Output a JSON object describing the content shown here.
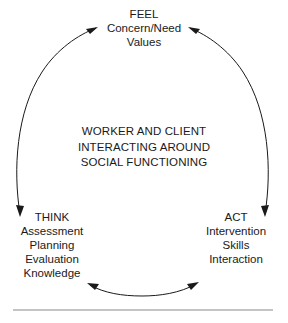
{
  "diagram": {
    "title": "Worker and Client Interacting Around Social Functioning",
    "type": "cyclical-process",
    "center": {
      "lines": [
        "WORKER AND CLIENT",
        "INTERACTING AROUND",
        "SOCIAL FUNCTIONING"
      ]
    },
    "nodes": [
      {
        "id": "feel",
        "position": "top",
        "title": "FEEL",
        "lines": [
          "Concern/Need",
          "Values"
        ]
      },
      {
        "id": "think",
        "position": "bottom-left",
        "title": "THINK",
        "lines": [
          "Assessment",
          "Planning",
          "Evaluation",
          "Knowledge"
        ]
      },
      {
        "id": "act",
        "position": "bottom-right",
        "title": "ACT",
        "lines": [
          "Intervention",
          "Skills",
          "Interaction"
        ]
      }
    ],
    "arrows": [
      {
        "id": "think-to-feel",
        "from": "think",
        "to": "feel",
        "side": "left",
        "direction": "bidirectional"
      },
      {
        "id": "act-to-feel",
        "from": "act",
        "to": "feel",
        "side": "right",
        "direction": "bidirectional"
      },
      {
        "id": "act-to-think",
        "from": "act",
        "to": "think",
        "side": "bottom",
        "direction": "bidirectional"
      }
    ],
    "colors": {
      "stroke": "#1a1a1a",
      "text": "#1a1a1a",
      "background": "#ffffff",
      "rule": "#b0b0b0"
    }
  }
}
